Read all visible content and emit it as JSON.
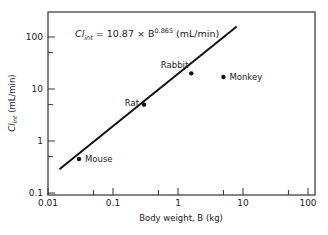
{
  "chart_data": {
    "type": "scatter",
    "title": "",
    "xlabel": "Body weight, B (kg)",
    "ylabel": "Cl_int (mL/min)",
    "xscale": "log",
    "yscale": "log",
    "xlim": [
      0.01,
      100
    ],
    "ylim": [
      0.1,
      200
    ],
    "grid": false,
    "legend": null,
    "x_ticks": [
      {
        "value": 0.01,
        "label": "0.01"
      },
      {
        "value": 0.1,
        "label": "0.1"
      },
      {
        "value": 1,
        "label": "1"
      },
      {
        "value": 10,
        "label": "10"
      },
      {
        "value": 100,
        "label": "100"
      }
    ],
    "x_minor_ticks": [
      0.05,
      0.5,
      5,
      50
    ],
    "y_ticks": [
      {
        "value": 0.1,
        "label": "0.1"
      },
      {
        "value": 1,
        "label": "1"
      },
      {
        "value": 10,
        "label": "10"
      },
      {
        "value": 100,
        "label": "100"
      }
    ],
    "y_minor_ticks": [
      0.5,
      5,
      50
    ],
    "series": [
      {
        "name": "Species",
        "points": [
          {
            "label": "Mouse",
            "x": 0.03,
            "y": 0.45
          },
          {
            "label": "Rat",
            "x": 0.3,
            "y": 5.0
          },
          {
            "label": "Rabbit",
            "x": 1.6,
            "y": 20.0
          },
          {
            "label": "Monkey",
            "x": 5.0,
            "y": 17.0
          }
        ]
      }
    ],
    "fit_line": {
      "equation_text": {
        "lhs": "Cl",
        "lhs_sub": "int",
        "mid": " = 10.87 × B",
        "exponent": "0.865",
        "units": " (mL/min)"
      },
      "coefficient": 10.87,
      "exponent": 0.865,
      "x_range": [
        0.015,
        8.0
      ]
    }
  }
}
